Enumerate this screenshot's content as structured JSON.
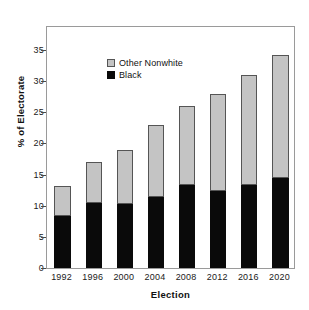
{
  "chart_data": {
    "type": "bar",
    "stacked": true,
    "title": "",
    "xlabel": "Election",
    "ylabel": "% of Electorate",
    "categories": [
      "1992",
      "1996",
      "2000",
      "2004",
      "2008",
      "2012",
      "2016",
      "2020"
    ],
    "ylim": [
      0,
      35
    ],
    "yticks": [
      0,
      5,
      10,
      15,
      20,
      25,
      30,
      35
    ],
    "grid": false,
    "legend_position": "top-left",
    "series": [
      {
        "name": "Black",
        "color": "#0a0a0a",
        "values": [
          8.3,
          10.4,
          10.3,
          11.4,
          13.4,
          12.4,
          13.4,
          14.5
        ]
      },
      {
        "name": "Other Nonwhite",
        "color": "#c4c4c4",
        "values": [
          4.9,
          6.6,
          8.7,
          11.6,
          12.6,
          15.6,
          17.6,
          19.7
        ]
      }
    ],
    "totals": [
      13.2,
      17.0,
      19.0,
      23.0,
      26.0,
      28.0,
      31.0,
      34.2
    ]
  },
  "legend": {
    "entries": [
      {
        "label": "Other Nonwhite",
        "swatch": "light-gray-square"
      },
      {
        "label": "Black",
        "swatch": "black-square"
      }
    ]
  }
}
